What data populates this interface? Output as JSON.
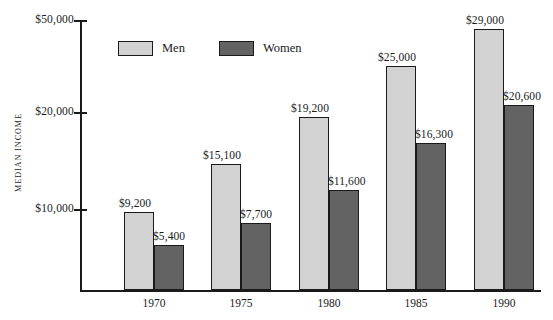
{
  "chart_data": {
    "type": "bar",
    "title": "",
    "xlabel": "",
    "ylabel": "MEDIAN INCOME",
    "categories": [
      "1970",
      "1975",
      "1980",
      "1985",
      "1990"
    ],
    "series": [
      {
        "name": "Men",
        "color": "#d2d2d2",
        "values": [
          9200,
          15100,
          19200,
          25000,
          29000
        ],
        "labels": [
          "$9,200",
          "$15,100",
          "$19,200",
          "$25,000",
          "$29,000"
        ]
      },
      {
        "name": "Women",
        "color": "#636363",
        "values": [
          5400,
          7700,
          11600,
          16300,
          20600
        ],
        "labels": [
          "$5,400",
          "$7,700",
          "$11,600",
          "$16,300",
          "$20,600"
        ]
      }
    ],
    "y_ticks": [
      10000,
      20000,
      50000
    ],
    "y_tick_labels": [
      "$10,000",
      "$20,000",
      "$50,000"
    ],
    "ylim": [
      0,
      50000
    ],
    "grid": false,
    "legend_position": "top-left-inside",
    "note": "vertical axis is visually compressed above $20,000"
  },
  "legend": {
    "items": [
      {
        "label": "Men",
        "color": "#d2d2d2"
      },
      {
        "label": "Women",
        "color": "#636363"
      }
    ]
  },
  "axis": {
    "y_title": "MEDIAN INCOME",
    "y_labels": [
      "$50,000",
      "$20,000",
      "$10,000"
    ],
    "x_labels": [
      "1970",
      "1975",
      "1980",
      "1985",
      "1990"
    ]
  },
  "bars": [
    {
      "group": "1970",
      "series": "Men",
      "label": "$9,200",
      "left": 124,
      "top": 212,
      "width": 30,
      "height": 78,
      "color": "#d2d2d2",
      "label_left": 119,
      "label_top": 197
    },
    {
      "group": "1970",
      "series": "Women",
      "label": "$5,400",
      "left": 154,
      "top": 245,
      "width": 30,
      "height": 45,
      "color": "#636363",
      "label_left": 153,
      "label_top": 230
    },
    {
      "group": "1975",
      "series": "Men",
      "label": "$15,100",
      "left": 211,
      "top": 164,
      "width": 30,
      "height": 126,
      "color": "#d2d2d2",
      "label_left": 203,
      "label_top": 149
    },
    {
      "group": "1975",
      "series": "Women",
      "label": "$7,700",
      "left": 241,
      "top": 223,
      "width": 30,
      "height": 67,
      "color": "#636363",
      "label_left": 240,
      "label_top": 208
    },
    {
      "group": "1980",
      "series": "Men",
      "label": "$19,200",
      "left": 299,
      "top": 117,
      "width": 30,
      "height": 173,
      "color": "#d2d2d2",
      "label_left": 291,
      "label_top": 102
    },
    {
      "group": "1980",
      "series": "Women",
      "label": "$11,600",
      "left": 329,
      "top": 190,
      "width": 30,
      "height": 100,
      "color": "#636363",
      "label_left": 328,
      "label_top": 175
    },
    {
      "group": "1985",
      "series": "Men",
      "label": "$25,000",
      "left": 386,
      "top": 66,
      "width": 30,
      "height": 224,
      "color": "#d2d2d2",
      "label_left": 378,
      "label_top": 51
    },
    {
      "group": "1985",
      "series": "Women",
      "label": "$16,300",
      "left": 416,
      "top": 143,
      "width": 30,
      "height": 147,
      "color": "#636363",
      "label_left": 415,
      "label_top": 128
    },
    {
      "group": "1990",
      "series": "Men",
      "label": "$29,000",
      "left": 474,
      "top": 29,
      "width": 30,
      "height": 261,
      "color": "#d2d2d2",
      "label_left": 466,
      "label_top": 14
    },
    {
      "group": "1990",
      "series": "Women",
      "label": "$20,600",
      "left": 504,
      "top": 105,
      "width": 30,
      "height": 185,
      "color": "#636363",
      "label_left": 503,
      "label_top": 90
    }
  ],
  "y_ticks_px": [
    {
      "label": "$50,000",
      "top": 20
    },
    {
      "label": "$20,000",
      "top": 112
    },
    {
      "label": "$10,000",
      "top": 209
    }
  ],
  "x_labels_px": [
    {
      "label": "1970",
      "left": 154
    },
    {
      "label": "1975",
      "left": 241
    },
    {
      "label": "1980",
      "left": 329
    },
    {
      "label": "1985",
      "left": 416
    },
    {
      "label": "1990",
      "left": 504
    }
  ],
  "colors": {
    "men": "#d2d2d2",
    "women": "#636363",
    "axis": "#1a1a1a",
    "background": "#ffffff"
  }
}
